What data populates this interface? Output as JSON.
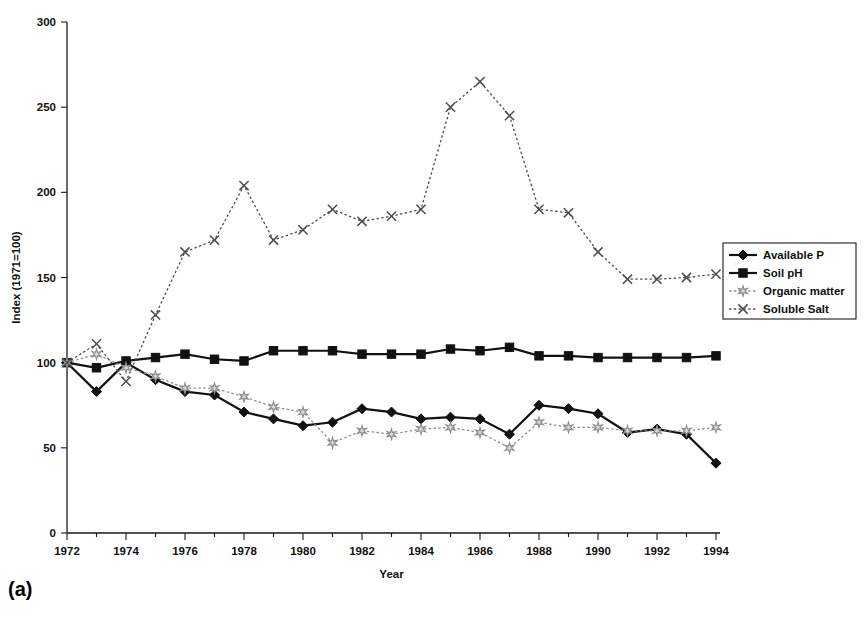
{
  "figure": {
    "caption": "(a)"
  },
  "chart_data": {
    "type": "line",
    "title": "",
    "xlabel": "Year",
    "ylabel": "Index (1971=100)",
    "xlim": [
      1972,
      1994
    ],
    "ylim": [
      0,
      300
    ],
    "ytick_step": 50,
    "yticks": [
      0,
      50,
      100,
      150,
      200,
      250,
      300
    ],
    "xticks": [
      1972,
      1974,
      1976,
      1978,
      1980,
      1982,
      1984,
      1986,
      1988,
      1990,
      1992,
      1994
    ],
    "xtick_minor_step": 1,
    "grid": false,
    "legend_position": "right",
    "x": [
      1972,
      1973,
      1974,
      1975,
      1976,
      1977,
      1978,
      1979,
      1980,
      1981,
      1982,
      1983,
      1984,
      1985,
      1986,
      1987,
      1988,
      1989,
      1990,
      1991,
      1992,
      1993,
      1994
    ],
    "series": [
      {
        "name": "Available P",
        "marker": "diamond",
        "line": "solid",
        "color": "#111111",
        "values": [
          100,
          83,
          100,
          90,
          83,
          81,
          71,
          67,
          63,
          65,
          73,
          71,
          67,
          68,
          67,
          58,
          75,
          73,
          70,
          59,
          61,
          58,
          41
        ]
      },
      {
        "name": "Soil pH",
        "marker": "square",
        "line": "solid",
        "color": "#111111",
        "values": [
          100,
          97,
          101,
          103,
          105,
          102,
          101,
          107,
          107,
          107,
          105,
          105,
          105,
          108,
          107,
          109,
          104,
          104,
          103,
          103,
          103,
          103,
          104
        ]
      },
      {
        "name": "Organic matter",
        "marker": "star",
        "line": "dotted",
        "color": "#8c8c8c",
        "values": [
          100,
          105,
          97,
          92,
          85,
          85,
          80,
          74,
          71,
          53,
          60,
          58,
          61,
          62,
          59,
          50,
          65,
          62,
          62,
          60,
          60,
          60,
          62
        ]
      },
      {
        "name": "Soluble Salt",
        "marker": "cross",
        "line": "dotted",
        "color": "#4d4d4d",
        "values": [
          100,
          111,
          89,
          128,
          165,
          172,
          204,
          172,
          178,
          190,
          183,
          186,
          190,
          250,
          265,
          245,
          190,
          188,
          165,
          149,
          149,
          150,
          152
        ]
      }
    ]
  },
  "axes": {
    "y_tick_labels": [
      "300",
      "250",
      "200",
      "150",
      "100",
      "50",
      "0"
    ],
    "x_tick_labels": [
      "1972",
      "1974",
      "1976",
      "1978",
      "1980",
      "1982",
      "1984",
      "1986",
      "1988",
      "1990",
      "1992",
      "1994"
    ],
    "x_title": "Year",
    "y_title": "Index (1971=100)"
  },
  "legend": {
    "entries": [
      {
        "label": "Available P"
      },
      {
        "label": "Soil pH"
      },
      {
        "label": "Organic matter"
      },
      {
        "label": "Soluble Salt"
      }
    ]
  }
}
